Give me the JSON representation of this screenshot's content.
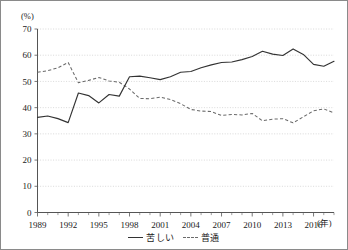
{
  "chart_data": {
    "type": "line",
    "title": "",
    "xlabel": "(年)",
    "ylabel": "(%)",
    "ylim": [
      0,
      70
    ],
    "xlim": [
      1989,
      2018
    ],
    "yticks": [
      0,
      10,
      20,
      30,
      40,
      50,
      60,
      70
    ],
    "xticks": [
      1989,
      1992,
      1995,
      1998,
      2001,
      2004,
      2007,
      2010,
      2013,
      2016
    ],
    "grid": true,
    "legend_position": "bottom-center",
    "x": [
      1989,
      1990,
      1991,
      1992,
      1993,
      1994,
      1995,
      1996,
      1997,
      1998,
      1999,
      2000,
      2001,
      2002,
      2003,
      2004,
      2005,
      2006,
      2007,
      2008,
      2009,
      2010,
      2011,
      2012,
      2013,
      2014,
      2015,
      2016,
      2017,
      2018
    ],
    "series": [
      {
        "name": "苦しい",
        "style": "solid",
        "color": "#333333",
        "values": [
          36.3,
          36.8,
          35.8,
          34.3,
          45.6,
          44.6,
          41.8,
          45.0,
          44.4,
          51.8,
          52.0,
          51.4,
          50.7,
          51.8,
          53.5,
          53.8,
          55.2,
          56.3,
          57.2,
          57.4,
          58.3,
          59.5,
          61.5,
          60.4,
          59.9,
          62.4,
          60.3,
          56.5,
          55.8,
          57.7
        ]
      },
      {
        "name": "普通",
        "style": "dashed",
        "color": "#6b6b6b",
        "values": [
          53.5,
          54.1,
          55.2,
          57.2,
          49.5,
          50.4,
          51.5,
          50.2,
          49.7,
          47.1,
          43.5,
          43.4,
          44.0,
          43.1,
          41.5,
          39.3,
          38.7,
          38.5,
          37.0,
          37.4,
          37.2,
          37.8,
          35.0,
          35.6,
          35.8,
          34.2,
          36.5,
          38.8,
          39.5,
          38.0
        ]
      }
    ],
    "legend": [
      {
        "label": "苦しい",
        "style": "solid"
      },
      {
        "label": "普通",
        "style": "dashed"
      }
    ]
  }
}
